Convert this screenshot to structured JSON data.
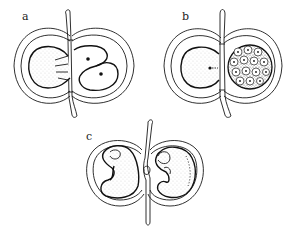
{
  "figure": {
    "panels": [
      {
        "id": "a",
        "label": "a",
        "description": "two-cell stage beside yolk sphere within double-lobed capsule"
      },
      {
        "id": "b",
        "label": "b",
        "description": "multicellular stage; cellular mass beside yolk sphere"
      },
      {
        "id": "c",
        "label": "c",
        "description": "two curved embryos in separated capsules"
      }
    ],
    "colors": {
      "ink": "#1a1a1a",
      "background": "#ffffff"
    }
  }
}
